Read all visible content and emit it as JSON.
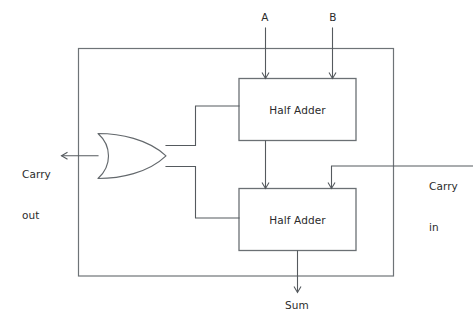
{
  "diagram": {
    "colors": {
      "wire": "#555a5e",
      "box_border": "#6b7074",
      "frame_border": "#6e7377",
      "gate_border": "#63686c",
      "text": "#2b2b2b",
      "background": "#ffffff"
    },
    "inputs": [
      {
        "id": "a",
        "label": "A"
      },
      {
        "id": "b",
        "label": "B"
      },
      {
        "id": "carry_in",
        "label": "Carry\nin",
        "line1": "Carry",
        "line2": "in"
      }
    ],
    "outputs": [
      {
        "id": "carry_out",
        "label": "Carry\nout",
        "line1": "Carry",
        "line2": "out"
      },
      {
        "id": "sum",
        "label": "Sum"
      }
    ],
    "blocks": [
      {
        "id": "half-adder-top",
        "label": "Half Adder"
      },
      {
        "id": "half-adder-bottom",
        "label": "Half Adder"
      }
    ],
    "gates": [
      {
        "id": "or-gate",
        "type": "OR",
        "label": ""
      }
    ]
  }
}
